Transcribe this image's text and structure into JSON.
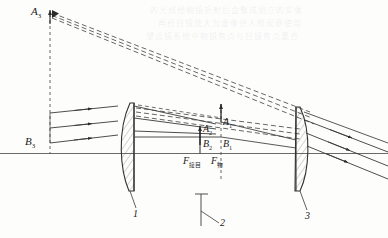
{
  "figure": {
    "axis_label": "optical-axis",
    "stroke_color": "#3a3a3a",
    "dash_color": "#4a4a4a",
    "axis_color": "#6a6a6a"
  },
  "labels": {
    "object_top": "A",
    "object_top_sub": "3",
    "object_bottom": "B",
    "object_bottom_sub": "3",
    "image1_top": "A",
    "image1_top_sub": "1",
    "image1_bottom": "B",
    "image1_bottom_sub": "1",
    "image2_top": "A",
    "image2_top_sub": "2",
    "image2_bottom": "B",
    "image2_bottom_sub": "2",
    "focus_eyepiece": "F",
    "focus_eyepiece_sub": "接目",
    "focus_objective": "F",
    "focus_objective_sub": "物"
  },
  "callouts": [
    {
      "id": "callout-1",
      "label": "1",
      "refers_to": "objective-lens"
    },
    {
      "id": "callout-2",
      "label": "2",
      "refers_to": "intermediate-image-plane"
    },
    {
      "id": "callout-3",
      "label": "3",
      "refers_to": "eyepiece-lens"
    }
  ],
  "elements": {
    "lens_objective": "objective-lens",
    "lens_eyepiece": "eyepiece-lens",
    "image_plane": "intermediate-image-plane"
  },
  "background_text": {
    "line1": "的光线经物镜折射后会聚成倒立的实像",
    "line2": "再经目镜放大为虚像供人眼观察使用",
    "line3": "望远镜系统中物镜焦点与目镜焦点重合"
  }
}
